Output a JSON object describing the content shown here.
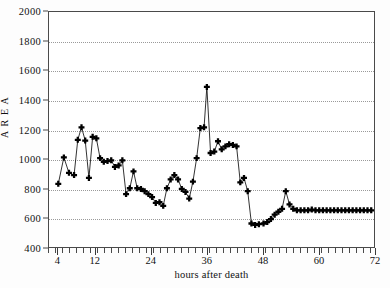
{
  "chart_data": {
    "type": "line",
    "title": "",
    "xlabel": "hours after death",
    "ylabel": "A R E A",
    "xlim": [
      2,
      72
    ],
    "ylim": [
      400,
      2000
    ],
    "grid": true,
    "legend": false,
    "marker": "plus-filled",
    "line_color": "#1a1a1a",
    "marker_color": "#000000",
    "y_ticks": [
      400,
      600,
      800,
      1000,
      1200,
      1400,
      1600,
      1800,
      2000
    ],
    "y_tick_labels": [
      "400",
      "600",
      "800",
      "1000",
      "1200",
      "1400",
      "1600",
      "1800",
      "2000"
    ],
    "x_ticks": [
      4,
      12,
      24,
      36,
      48,
      60,
      72
    ],
    "x_tick_labels": [
      "4",
      "12",
      "24",
      "36",
      "48",
      "60",
      "72"
    ],
    "x_minor_tick_step": 1.5,
    "series": [
      {
        "name": "area",
        "x": [
          4.0,
          5.2,
          6.3,
          7.4,
          8.2,
          9.0,
          9.8,
          10.6,
          11.4,
          12.2,
          13.0,
          13.8,
          14.6,
          15.4,
          16.2,
          17.0,
          17.8,
          18.6,
          19.4,
          20.2,
          21.0,
          21.8,
          22.6,
          23.4,
          24.2,
          25.0,
          25.8,
          26.6,
          27.4,
          28.2,
          29.0,
          29.8,
          30.6,
          31.4,
          32.2,
          33.0,
          33.8,
          34.6,
          35.4,
          36.0,
          36.8,
          37.6,
          38.4,
          39.2,
          40.0,
          40.8,
          41.6,
          42.4,
          43.2,
          44.0,
          44.8,
          45.6,
          46.4,
          47.2,
          48.2,
          49.0,
          49.8,
          50.6,
          51.4,
          52.2,
          53.0,
          53.8,
          54.6,
          55.4,
          56.2,
          57.0,
          57.8,
          58.6,
          59.4,
          60.2,
          61.0,
          61.8,
          62.6,
          63.4,
          64.2,
          65.0,
          65.8,
          66.6,
          67.4,
          68.2,
          69.0,
          69.8,
          70.6,
          71.4
        ],
        "y": [
          830,
          1010,
          905,
          890,
          1130,
          1215,
          1125,
          870,
          1150,
          1140,
          1005,
          980,
          985,
          990,
          945,
          955,
          990,
          760,
          800,
          915,
          800,
          795,
          780,
          760,
          740,
          700,
          705,
          680,
          800,
          860,
          890,
          860,
          795,
          775,
          730,
          845,
          1005,
          1210,
          1215,
          1490,
          1040,
          1050,
          1120,
          1065,
          1085,
          1100,
          1095,
          1085,
          840,
          870,
          780,
          560,
          550,
          555,
          560,
          570,
          590,
          620,
          640,
          660,
          780,
          690,
          660,
          650,
          650,
          650,
          650,
          655,
          650,
          650,
          650,
          650,
          650,
          650,
          650,
          650,
          650,
          650,
          650,
          650,
          650,
          650,
          650,
          650
        ]
      }
    ]
  }
}
